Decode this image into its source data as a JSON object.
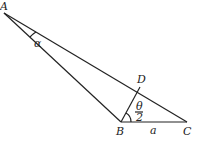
{
  "diagram": {
    "points": {
      "A": {
        "label": "A",
        "x": 4,
        "y": 13
      },
      "B": {
        "label": "B",
        "x": 121,
        "y": 122
      },
      "C": {
        "label": "C",
        "x": 187,
        "y": 122
      },
      "D": {
        "label": "D",
        "x": 140,
        "y": 87
      }
    },
    "angle_labels": {
      "alpha": "α",
      "theta_num": "θ",
      "theta_den": "2"
    },
    "side_labels": {
      "BC": "a"
    },
    "stroke_color": "#222222"
  }
}
